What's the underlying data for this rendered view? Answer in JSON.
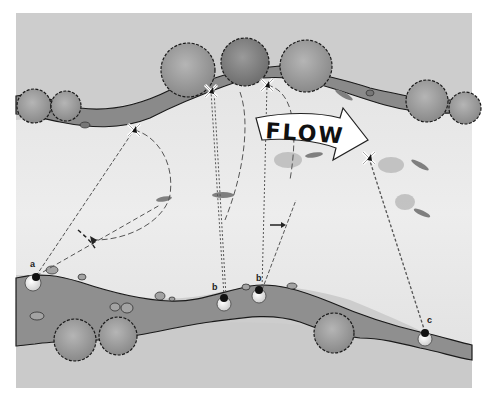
{
  "diagram": {
    "type": "river-casting-illustration",
    "flow_label": "FLOW",
    "anglers": [
      {
        "label": "a",
        "x": 33,
        "y": 283
      },
      {
        "label": "b",
        "x": 224,
        "y": 304
      },
      {
        "label": "b",
        "x": 259,
        "y": 296
      },
      {
        "label": "c",
        "x": 425,
        "y": 339
      }
    ],
    "cast_targets": [
      {
        "x": 134,
        "y": 130
      },
      {
        "x": 211,
        "y": 91
      },
      {
        "x": 267,
        "y": 85
      },
      {
        "x": 369,
        "y": 158
      }
    ],
    "colors": {
      "background": "#ffffff",
      "land": "#cfcfcf",
      "land_shade": "#bdbdbd",
      "water": "#e6e6e6",
      "bank": "#8a8a8a",
      "bank_outline": "#1a1a1a",
      "tree": "#9a9a9a",
      "tree_dark": "#7a7a7a",
      "line": "#555555",
      "fish": "#7f7f7f",
      "rock": "#a3a3a3"
    }
  }
}
